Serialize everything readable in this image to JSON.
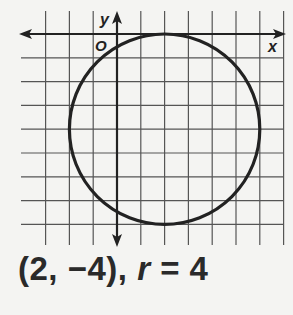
{
  "diagram": {
    "type": "coordinate-grid-circle",
    "axes": {
      "x_label": "x",
      "y_label": "y",
      "origin_label": "O"
    },
    "grid": {
      "x_min": -4,
      "x_max": 7,
      "y_min": -9,
      "y_max": 1,
      "unit": 1
    },
    "circle": {
      "center": [
        2,
        -4
      ],
      "radius": 4
    },
    "colors": {
      "background": "#f4f4f2",
      "grid": "#555555",
      "curve": "#222222"
    }
  },
  "caption": {
    "center_text": "(2, −4), ",
    "r_symbol": "r",
    "radius_text": " = 4"
  }
}
